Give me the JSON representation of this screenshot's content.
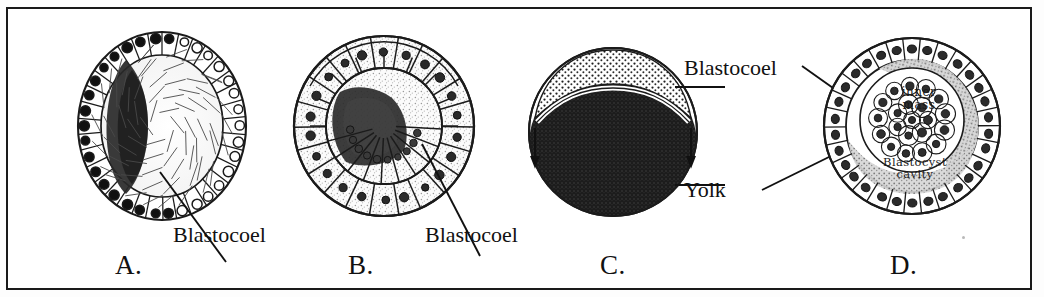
{
  "figure": {
    "panels": [
      {
        "id": "A",
        "letter": "A.",
        "label": "Blastocoel",
        "description": "Oval blastula with columnar outer cell layer, dark pigmented crescent and central blastocoel"
      },
      {
        "id": "B",
        "letter": "B.",
        "label": "Blastocoel",
        "description": "Round blastula with large stippled polygonal cells and eccentric dark blastocoel"
      },
      {
        "id": "C",
        "letter": "C.",
        "label_blastocoel": "Blastocoel",
        "label_yolk": "Yolk",
        "description": "Telolecithal egg with stippled blastodisc cap above a large dark yolk mass"
      },
      {
        "id": "D",
        "letter": "D.",
        "inner_label": "inner\nmass",
        "inner_label_line1": "inner",
        "inner_label_line2": "mass",
        "cavity_label_line1": "Blastocyst",
        "cavity_label_line2": "cavity",
        "description": "Mammalian blastocyst with trophoblast ring, inner cell mass and blastocyst cavity"
      }
    ],
    "colors": {
      "ink": "#111111",
      "frame": "#1a1a1a",
      "paper": "#ffffff",
      "yolk_dark": "#1b1b1b",
      "stipple_gray": "#8c8c8c"
    }
  }
}
